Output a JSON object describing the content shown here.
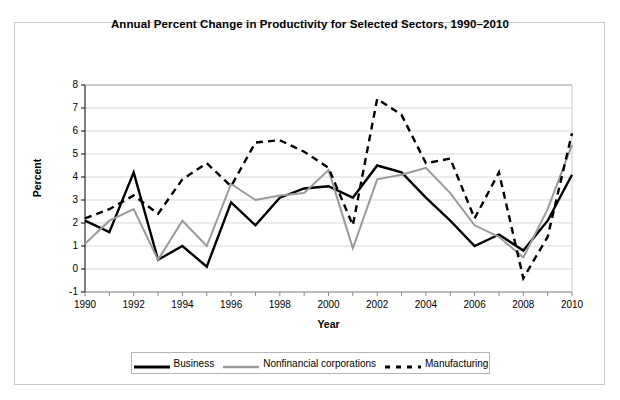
{
  "chart_data": {
    "type": "line",
    "title": "Annual Percent Change in Productivity for Selected Sectors, 1990–2010",
    "xlabel": "Year",
    "ylabel": "Percent",
    "x": [
      1990,
      1991,
      1992,
      1993,
      1994,
      1995,
      1996,
      1997,
      1998,
      1999,
      2000,
      2001,
      2002,
      2003,
      2004,
      2005,
      2006,
      2007,
      2008,
      2009,
      2010
    ],
    "xlim": [
      1990,
      2010
    ],
    "ylim": [
      -1,
      8
    ],
    "xticks": [
      1990,
      1992,
      1994,
      1996,
      1998,
      2000,
      2002,
      2004,
      2006,
      2008,
      2010
    ],
    "xtick_labels": [
      "1990",
      "1992",
      "1994",
      "1996",
      "1998",
      "2000",
      "2002",
      "2004",
      "2006",
      "2008",
      "2010"
    ],
    "yticks": [
      -1,
      0,
      1,
      2,
      3,
      4,
      5,
      6,
      7,
      8
    ],
    "ytick_labels": [
      "-1",
      "0",
      "1",
      "2",
      "3",
      "4",
      "5",
      "6",
      "7",
      "8"
    ],
    "grid": "horizontal",
    "legend_position": "bottom-center",
    "series": [
      {
        "name": "Business",
        "color": "#000000",
        "style": "solid",
        "width": 2.4,
        "values": [
          2.1,
          1.6,
          4.2,
          0.4,
          1.0,
          0.1,
          2.9,
          1.9,
          3.1,
          3.5,
          3.6,
          3.1,
          4.5,
          4.2,
          3.1,
          2.1,
          1.0,
          1.5,
          0.8,
          2.1,
          4.1
        ]
      },
      {
        "name": "Nonfinancial corporations",
        "color": "#9a9a9a",
        "style": "solid",
        "width": 2.0,
        "values": [
          1.1,
          2.1,
          2.6,
          0.4,
          2.1,
          1.0,
          3.7,
          3.0,
          3.2,
          3.3,
          4.3,
          0.9,
          3.9,
          4.1,
          4.4,
          3.3,
          1.9,
          1.4,
          0.5,
          2.6,
          5.4
        ]
      },
      {
        "name": "Manufacturing",
        "color": "#000000",
        "style": "dashed",
        "width": 2.4,
        "values": [
          2.2,
          2.6,
          3.2,
          2.4,
          3.9,
          4.6,
          3.6,
          5.5,
          5.6,
          5.1,
          4.4,
          1.9,
          7.4,
          6.7,
          4.6,
          4.8,
          2.2,
          4.2,
          -0.4,
          1.4,
          5.9
        ]
      }
    ]
  },
  "legend": {
    "items": [
      {
        "label": "Business"
      },
      {
        "label": "Nonfinancial corporations"
      },
      {
        "label": "Manufacturing"
      }
    ]
  },
  "colors": {
    "axis": "#000000",
    "grid": "#d9d9d9",
    "frame": "#c8c8c8",
    "background": "#ffffff"
  }
}
